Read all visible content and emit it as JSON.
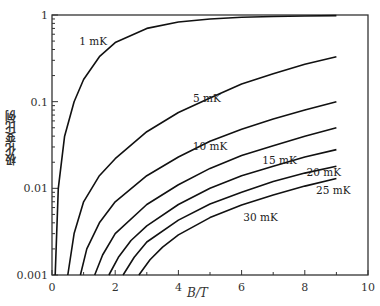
{
  "chart_data": {
    "type": "line",
    "title": "",
    "xlabel": "B/T",
    "ylabel": "极化变比例",
    "xlim": [
      0,
      10
    ],
    "ylim": [
      0.001,
      1
    ],
    "yscale": "log",
    "xticks": [
      "0",
      "2",
      "4",
      "6",
      "8",
      "10"
    ],
    "yticks": [
      "0.001",
      "0.01",
      "0.1",
      "1"
    ],
    "grid": false,
    "series": [
      {
        "name": "1 mK",
        "x": [
          0.1,
          0.2,
          0.4,
          0.7,
          1,
          1.5,
          2,
          3,
          4,
          5,
          6,
          7,
          8,
          9
        ],
        "y": [
          0.001,
          0.01,
          0.04,
          0.1,
          0.18,
          0.33,
          0.48,
          0.7,
          0.83,
          0.9,
          0.94,
          0.96,
          0.975,
          0.985
        ]
      },
      {
        "name": "5 mK",
        "x": [
          0.5,
          0.7,
          1,
          1.5,
          2,
          3,
          4,
          5,
          6,
          7,
          8,
          9
        ],
        "y": [
          0.001,
          0.003,
          0.007,
          0.014,
          0.022,
          0.045,
          0.075,
          0.11,
          0.16,
          0.21,
          0.27,
          0.33
        ]
      },
      {
        "name": "10 mK",
        "x": [
          0.9,
          1.1,
          1.5,
          2,
          3,
          4,
          5,
          6,
          7,
          8,
          9
        ],
        "y": [
          0.001,
          0.002,
          0.004,
          0.007,
          0.014,
          0.023,
          0.035,
          0.048,
          0.063,
          0.08,
          0.1
        ]
      },
      {
        "name": "15 mK",
        "x": [
          1.35,
          1.6,
          2,
          3,
          4,
          5,
          6,
          7,
          8,
          9
        ],
        "y": [
          0.001,
          0.0017,
          0.003,
          0.0065,
          0.011,
          0.017,
          0.024,
          0.031,
          0.04,
          0.05
        ]
      },
      {
        "name": "20 mK",
        "x": [
          1.8,
          2.1,
          2.5,
          3,
          4,
          5,
          6,
          7,
          8,
          9
        ],
        "y": [
          0.001,
          0.0016,
          0.0025,
          0.0037,
          0.0065,
          0.01,
          0.014,
          0.018,
          0.023,
          0.028
        ]
      },
      {
        "name": "25 mK",
        "x": [
          2.25,
          2.6,
          3,
          4,
          5,
          6,
          7,
          8,
          9
        ],
        "y": [
          0.001,
          0.0016,
          0.0024,
          0.0043,
          0.0066,
          0.009,
          0.012,
          0.015,
          0.018
        ]
      },
      {
        "name": "30 mK",
        "x": [
          2.75,
          3.1,
          3.5,
          4,
          5,
          6,
          7,
          8,
          9
        ],
        "y": [
          0.001,
          0.0015,
          0.0021,
          0.0029,
          0.0046,
          0.0064,
          0.0084,
          0.0106,
          0.013
        ]
      }
    ],
    "annotations": [
      {
        "text": "1 mK",
        "x": 1.3,
        "y": 0.45
      },
      {
        "text": "5 mK",
        "x": 4.9,
        "y": 0.1
      },
      {
        "text": "10 mK",
        "x": 5.0,
        "y": 0.028
      },
      {
        "text": "15 mK",
        "x": 7.2,
        "y": 0.019
      },
      {
        "text": "20 mK",
        "x": 8.6,
        "y": 0.014
      },
      {
        "text": "25 mK",
        "x": 8.9,
        "y": 0.0085
      },
      {
        "text": "30 mK",
        "x": 6.6,
        "y": 0.0042
      }
    ]
  }
}
